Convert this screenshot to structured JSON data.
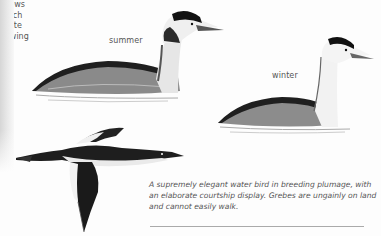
{
  "page": {
    "illustrations": [
      {
        "name": "summer",
        "label": "summer",
        "plumage": "breeding"
      },
      {
        "name": "winter",
        "label": "winter",
        "plumage": "non-breeding"
      },
      {
        "name": "flight",
        "label_lines": [
          "shows",
          "much",
          "white",
          "in wing"
        ]
      }
    ],
    "description": "A supremely elegant water bird in breeding plumage, with an elaborate courtship display. Grebes are ungainly on land and cannot easily walk.",
    "colors": {
      "ink": "#1a1a1a",
      "text": "#555555",
      "rule": "#aaaaaa",
      "paper": "#fdfdfd"
    }
  }
}
